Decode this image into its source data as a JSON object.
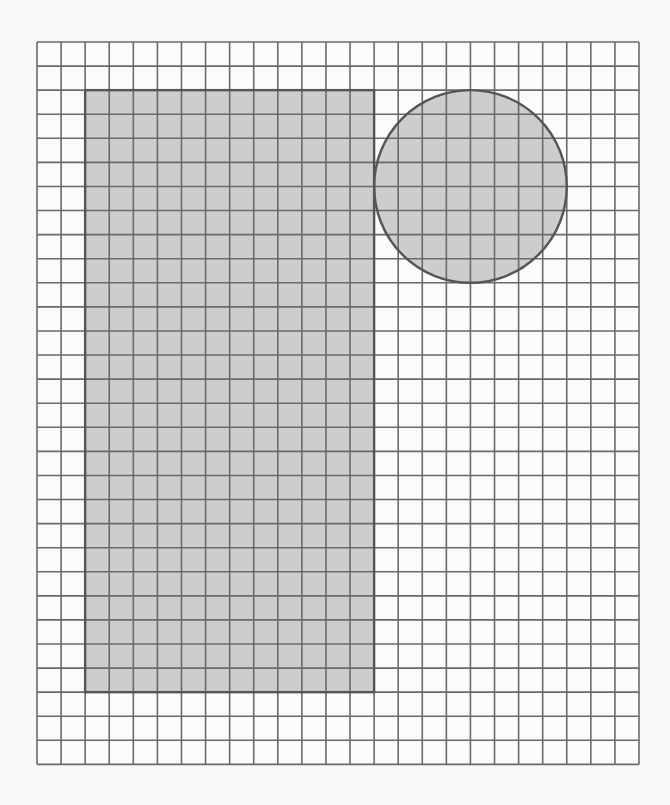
{
  "diagram": {
    "type": "grid-shapes",
    "grid": {
      "origin_x": 37,
      "origin_y": 42,
      "cols": 25,
      "rows": 30,
      "cell_size": 24.08,
      "line_color": "#6a6a6a",
      "line_width": 1.6,
      "background": "#fbfbfa"
    },
    "shapes": [
      {
        "id": "rectangle",
        "kind": "rectangle",
        "col_start": 2,
        "row_start": 2,
        "width_cells": 12,
        "height_cells": 25,
        "fill": "#cdcdcd",
        "stroke": "#555555",
        "stroke_width": 2.4
      },
      {
        "id": "circle",
        "kind": "circle",
        "center_col": 18,
        "center_row": 6,
        "radius_cells": 4,
        "fill": "#cdcdcd",
        "stroke": "#555555",
        "stroke_width": 2.4
      }
    ]
  }
}
